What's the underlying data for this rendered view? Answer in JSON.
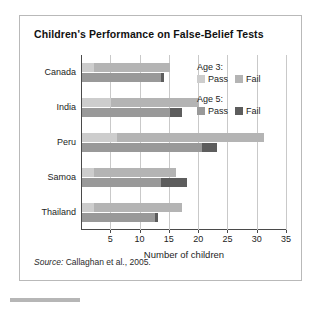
{
  "figure": {
    "title": "Children's Performance on False-Belief Tests",
    "source_label": "Source:",
    "source_text": " Callaghan et al., 2005."
  },
  "legend": {
    "groups": [
      {
        "heading": "Age 3:",
        "items": [
          {
            "label": "Pass",
            "color": "#cdcdcd"
          },
          {
            "label": "Fail",
            "color": "#b4b4b4"
          }
        ]
      },
      {
        "heading": "Age 5:",
        "items": [
          {
            "label": "Pass",
            "color": "#999999"
          },
          {
            "label": "Fail",
            "color": "#5d5d5d"
          }
        ]
      }
    ]
  },
  "chart_data": {
    "type": "bar",
    "orientation": "horizontal",
    "title": "Children's Performance on False-Belief Tests",
    "xlabel": "Number of children",
    "ylabel": "",
    "xlim": [
      0,
      35
    ],
    "xticks": [
      5,
      10,
      15,
      20,
      25,
      30,
      35
    ],
    "grid": true,
    "legend_position": "inside-top-right",
    "categories": [
      "Canada",
      "India",
      "Peru",
      "Samoa",
      "Thailand"
    ],
    "series": [
      {
        "name": "Age 3: Pass",
        "color": "#cdcdcd",
        "values": [
          2,
          5,
          6,
          2,
          2
        ]
      },
      {
        "name": "Age 3: Fail",
        "color": "#b4b4b4",
        "values": [
          13,
          15,
          25,
          14,
          15
        ]
      },
      {
        "name": "Age 5: Pass",
        "color": "#999999",
        "values": [
          13.5,
          15,
          20.5,
          13.5,
          12.5
        ]
      },
      {
        "name": "Age 5: Fail",
        "color": "#5d5d5d",
        "values": [
          0.5,
          2,
          2.5,
          4.5,
          0.5
        ]
      }
    ],
    "totals": {
      "age3": [
        15,
        20,
        31,
        16,
        17
      ],
      "age5": [
        14,
        17,
        23,
        18,
        13
      ]
    }
  }
}
